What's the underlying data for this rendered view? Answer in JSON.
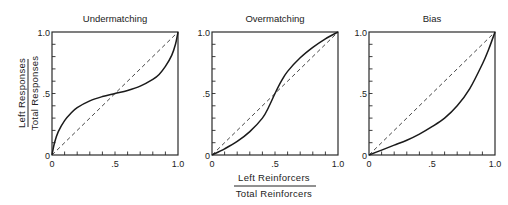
{
  "chart_data": [
    {
      "type": "line",
      "title": "Undermatching",
      "xlim": [
        0,
        1
      ],
      "ylim": [
        0,
        1
      ],
      "x_tick_labels": [
        "0",
        ".5",
        "1.0"
      ],
      "y_tick_labels": [
        "0",
        ".5",
        "1.0"
      ],
      "minor_tick_step": 0.1,
      "series": [
        {
          "name": "matching line",
          "style": "dashed",
          "x": [
            0,
            1
          ],
          "y": [
            0,
            1
          ]
        },
        {
          "name": "obtained",
          "style": "solid",
          "x": [
            0,
            0.02,
            0.05,
            0.1,
            0.15,
            0.2,
            0.3,
            0.4,
            0.5,
            0.6,
            0.7,
            0.8,
            0.85,
            0.9,
            0.95,
            0.98,
            1.0
          ],
          "y": [
            0,
            0.1,
            0.19,
            0.28,
            0.34,
            0.385,
            0.44,
            0.475,
            0.5,
            0.525,
            0.56,
            0.615,
            0.655,
            0.72,
            0.81,
            0.9,
            1.0
          ]
        }
      ]
    },
    {
      "type": "line",
      "title": "Overmatching",
      "xlim": [
        0,
        1
      ],
      "ylim": [
        0,
        1
      ],
      "x_tick_labels": [
        "0",
        ".5",
        "1.0"
      ],
      "y_tick_labels": [
        "0",
        ".5",
        "1.0"
      ],
      "minor_tick_step": 0.1,
      "series": [
        {
          "name": "matching line",
          "style": "dashed",
          "x": [
            0,
            1
          ],
          "y": [
            0,
            1
          ]
        },
        {
          "name": "obtained",
          "style": "solid",
          "x": [
            0,
            0.1,
            0.2,
            0.3,
            0.4,
            0.45,
            0.5,
            0.55,
            0.6,
            0.7,
            0.8,
            0.9,
            1.0
          ],
          "y": [
            0,
            0.05,
            0.11,
            0.19,
            0.3,
            0.39,
            0.5,
            0.6,
            0.68,
            0.79,
            0.875,
            0.945,
            1.0
          ]
        }
      ]
    },
    {
      "type": "line",
      "title": "Bias",
      "xlim": [
        0,
        1
      ],
      "ylim": [
        0,
        1
      ],
      "x_tick_labels": [
        "0",
        ".5",
        "1.0"
      ],
      "y_tick_labels": [
        "0",
        ".5",
        "1.0"
      ],
      "minor_tick_step": 0.1,
      "series": [
        {
          "name": "matching line",
          "style": "dashed",
          "x": [
            0,
            1
          ],
          "y": [
            0,
            1
          ]
        },
        {
          "name": "obtained",
          "style": "solid",
          "x": [
            0,
            0.1,
            0.2,
            0.3,
            0.4,
            0.5,
            0.6,
            0.7,
            0.8,
            0.9,
            0.95,
            1.0
          ],
          "y": [
            0,
            0.04,
            0.08,
            0.12,
            0.17,
            0.23,
            0.3,
            0.4,
            0.54,
            0.74,
            0.86,
            1.0
          ]
        }
      ]
    }
  ],
  "ylabel": {
    "numerator": "Left   Responses",
    "denominator": "Total   Responses"
  },
  "xlabel": {
    "numerator": "Left   Reinforcers",
    "denominator": "Total   Reinforcers"
  }
}
